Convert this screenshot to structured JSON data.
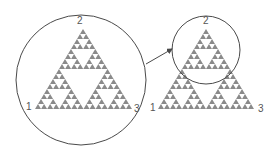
{
  "diagram": {
    "colors": {
      "fill": "#8a8a8a",
      "stroke": "#4a4a4a",
      "label": "#555555",
      "background": "#ffffff"
    },
    "depth": 4,
    "left_figure": {
      "triangle": {
        "left": [
          35,
          109
        ],
        "right": [
          132,
          109
        ],
        "apex": [
          83,
          29
        ]
      },
      "circle": {
        "cx": 81,
        "cy": 80,
        "r": 65
      },
      "labels": [
        {
          "text": "1",
          "x": 26,
          "y": 110
        },
        {
          "text": "2",
          "x": 77,
          "y": 24
        },
        {
          "text": "3",
          "x": 134,
          "y": 112
        }
      ]
    },
    "right_figure": {
      "triangle": {
        "left": [
          158,
          109
        ],
        "right": [
          254,
          109
        ],
        "apex": [
          206,
          29
        ]
      },
      "circle": {
        "cx": 206,
        "cy": 50,
        "r": 34
      },
      "labels": [
        {
          "text": "1",
          "x": 150,
          "y": 111
        },
        {
          "text": "2",
          "x": 203,
          "y": 24
        },
        {
          "text": "3",
          "x": 258,
          "y": 112
        }
      ]
    },
    "arrow": {
      "from": [
        146,
        64
      ],
      "to": [
        172,
        49
      ]
    }
  }
}
